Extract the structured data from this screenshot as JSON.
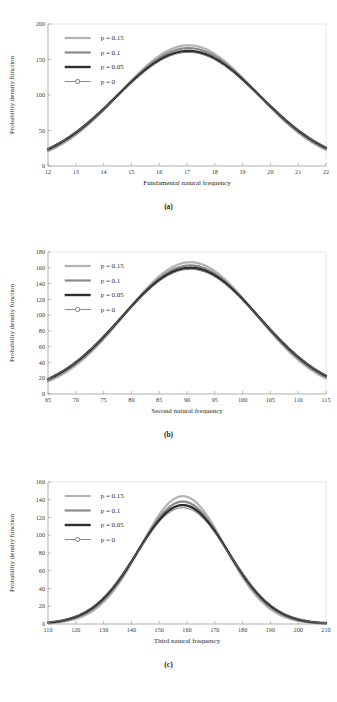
{
  "page": {
    "header_faint_text": "",
    "footer_faint_text": ""
  },
  "figures": [
    {
      "id": "fig-a",
      "panel_label": "(a)",
      "chart_data": {
        "type": "line",
        "title": "",
        "xlabel": "Fundamental natural frequency",
        "ylabel": "Probability density function",
        "xlim": [
          12,
          22
        ],
        "ylim": [
          0,
          200
        ],
        "xticks": [
          12,
          13,
          14,
          15,
          16,
          17,
          18,
          19,
          20,
          21,
          22
        ],
        "yticks": [
          0,
          50,
          100,
          150,
          200
        ],
        "ytick_labels": [
          "0",
          "50",
          "100",
          "150",
          "200"
        ],
        "grid": false,
        "legend_position": "upper-left",
        "series": [
          {
            "name": "p = 0.15",
            "color": "#b3b3b3",
            "width": 2.2,
            "marker": "none",
            "mean": 17.05,
            "sigma": 2.46,
            "peak": 170
          },
          {
            "name": "p = 0.1",
            "color": "#8a8a8a",
            "width": 2.2,
            "marker": "none",
            "mean": 17.05,
            "sigma": 2.52,
            "peak": 166
          },
          {
            "name": "p = 0.05",
            "color": "#2e2e2e",
            "width": 2.4,
            "marker": "none",
            "mean": 17.05,
            "sigma": 2.58,
            "peak": 162
          },
          {
            "name": "p = 0",
            "color": "#6f6f6f",
            "width": 1.0,
            "marker": "circle",
            "mean": 17.05,
            "sigma": 2.6,
            "peak": 160
          }
        ]
      }
    },
    {
      "id": "fig-b",
      "panel_label": "(b)",
      "chart_data": {
        "type": "line",
        "title": "",
        "xlabel": "Second natural frequency",
        "ylabel": "Probability density function",
        "xlim": [
          65,
          115
        ],
        "ylim": [
          0,
          180
        ],
        "xticks": [
          65,
          70,
          75,
          80,
          85,
          90,
          95,
          100,
          105,
          110,
          115
        ],
        "yticks": [
          0,
          20,
          40,
          60,
          80,
          100,
          120,
          140,
          160,
          180
        ],
        "ytick_labels": [
          "0",
          "20",
          "40",
          "60",
          "80",
          "100",
          "120",
          "140",
          "160",
          "180"
        ],
        "grid": false,
        "legend_position": "upper-left",
        "series": [
          {
            "name": "p = 0.15",
            "color": "#b3b3b3",
            "width": 2.2,
            "marker": "none",
            "mean": 90.6,
            "sigma": 11.8,
            "peak": 167
          },
          {
            "name": "p = 0.1",
            "color": "#8a8a8a",
            "width": 2.2,
            "marker": "none",
            "mean": 90.6,
            "sigma": 12.1,
            "peak": 163
          },
          {
            "name": "p = 0.05",
            "color": "#2e2e2e",
            "width": 2.4,
            "marker": "none",
            "mean": 90.6,
            "sigma": 12.4,
            "peak": 160
          },
          {
            "name": "p = 0",
            "color": "#6f6f6f",
            "width": 1.0,
            "marker": "circle",
            "mean": 90.6,
            "sigma": 12.5,
            "peak": 158
          }
        ]
      }
    },
    {
      "id": "fig-c",
      "panel_label": "(c)",
      "chart_data": {
        "type": "line",
        "title": "",
        "xlabel": "Third natural frequency",
        "ylabel": "Probability density function",
        "xlim": [
          110,
          210
        ],
        "ylim": [
          0,
          160
        ],
        "xticks": [
          110,
          120,
          130,
          140,
          150,
          160,
          170,
          180,
          190,
          200,
          210
        ],
        "yticks": [
          0,
          20,
          40,
          60,
          80,
          100,
          120,
          140,
          160
        ],
        "ytick_labels": [
          "0",
          "20",
          "40",
          "60",
          "80",
          "100",
          "120",
          "140",
          "160"
        ],
        "grid": false,
        "legend_position": "upper-left",
        "series": [
          {
            "name": "p = 0.15",
            "color": "#b3b3b3",
            "width": 2.2,
            "marker": "none",
            "mean": 158.5,
            "sigma": 15.2,
            "peak": 144
          },
          {
            "name": "p = 0.1",
            "color": "#8a8a8a",
            "width": 2.2,
            "marker": "none",
            "mean": 158.5,
            "sigma": 15.8,
            "peak": 138
          },
          {
            "name": "p = 0.05",
            "color": "#2e2e2e",
            "width": 2.4,
            "marker": "none",
            "mean": 158.5,
            "sigma": 16.3,
            "peak": 134
          },
          {
            "name": "p = 0",
            "color": "#6f6f6f",
            "width": 1.0,
            "marker": "circle",
            "mean": 158.5,
            "sigma": 16.6,
            "peak": 131
          }
        ]
      }
    }
  ]
}
